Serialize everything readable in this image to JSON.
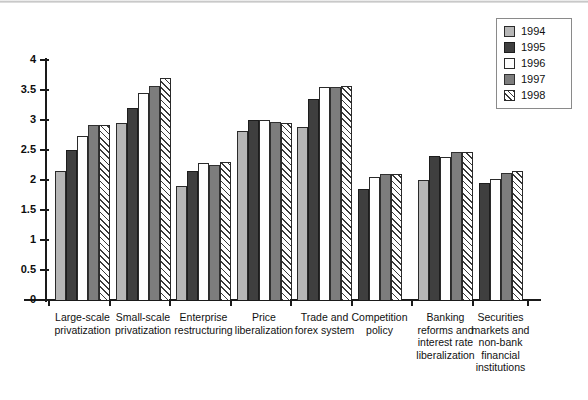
{
  "chart_data": {
    "type": "bar",
    "title": "",
    "xlabel": "",
    "ylabel": "",
    "ylim": [
      0,
      4
    ],
    "ytick_values": [
      0,
      0.5,
      1,
      1.5,
      2,
      2.5,
      3,
      3.5,
      4
    ],
    "ytick_labels": [
      "0",
      "0.5",
      "1",
      "1.5",
      "2",
      "2.5",
      "3",
      "3.5",
      "4"
    ],
    "grid": false,
    "legend_position": "top-right",
    "categories": [
      "Large-scale privatization",
      "Small-scale privatization",
      "Enterprise restructuring",
      "Price liberalization",
      "Trade and forex system",
      "Competition policy",
      "Banking reforms and interest rate liberalization",
      "Securities markets and non-bank financial institutions"
    ],
    "category_label_lines": [
      [
        "Large-scale",
        "privatization"
      ],
      [
        "Small-scale",
        "privatization"
      ],
      [
        "Enterprise",
        "restructuring"
      ],
      [
        "Price",
        "liberalization"
      ],
      [
        "Trade and",
        "forex system"
      ],
      [
        "Competition",
        "policy"
      ],
      [
        "Banking",
        "reforms and",
        "interest rate",
        "liberalization"
      ],
      [
        "Securities",
        "markets and",
        "non-bank",
        "financial",
        "institutions"
      ]
    ],
    "series": [
      {
        "name": "1994",
        "color": "#b6b6b6",
        "values": [
          2.15,
          2.95,
          1.9,
          2.82,
          2.88,
          null,
          2.0,
          null
        ]
      },
      {
        "name": "1995",
        "color": "#3f3f3f",
        "values": [
          2.5,
          3.2,
          2.15,
          3.0,
          3.35,
          1.85,
          2.4,
          1.95
        ]
      },
      {
        "name": "1996",
        "color": "#ffffff",
        "values": [
          2.73,
          3.45,
          2.28,
          3.0,
          3.55,
          2.05,
          2.38,
          2.02
        ]
      },
      {
        "name": "1997",
        "color": "#7d7d7d",
        "values": [
          2.92,
          3.56,
          2.25,
          2.97,
          3.55,
          2.1,
          2.47,
          2.12
        ]
      },
      {
        "name": "1998",
        "color": "hatched",
        "values": [
          2.92,
          3.7,
          2.3,
          2.95,
          3.57,
          2.1,
          2.47,
          2.15
        ]
      }
    ]
  },
  "legend": {
    "items": [
      {
        "label": "1994",
        "key": "y1994"
      },
      {
        "label": "1995",
        "key": "y1995"
      },
      {
        "label": "1996",
        "key": "y1996"
      },
      {
        "label": "1997",
        "key": "y1997"
      },
      {
        "label": "1998",
        "key": "y1998"
      }
    ]
  }
}
